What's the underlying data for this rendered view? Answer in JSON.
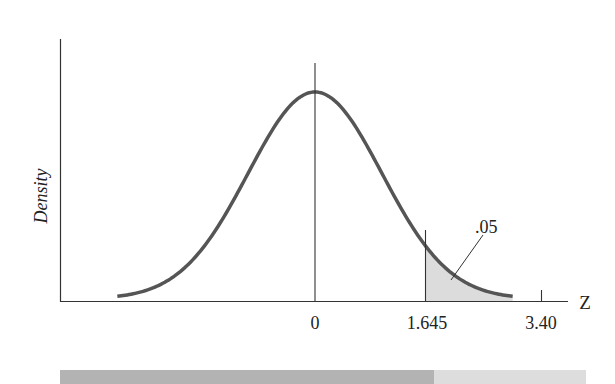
{
  "chart_data": {
    "type": "area",
    "title": "",
    "xlabel": "Z",
    "ylabel": "Density",
    "distribution": "standard normal",
    "x_ticks": [
      {
        "value": 0,
        "label": "0"
      },
      {
        "value": 1.645,
        "label": "1.645"
      },
      {
        "value": 3.4,
        "label": "3.40"
      }
    ],
    "shaded_region": {
      "from": 1.645,
      "to": "upper tail",
      "area": 0.05,
      "label": ".05"
    },
    "critical_value": 1.645,
    "test_statistic": 3.4,
    "xlim": [
      -3.5,
      3.9
    ],
    "grid": false,
    "legend": null,
    "bottom_bar": {
      "left_region": {
        "from": "-inf",
        "to": 1.645,
        "color": "#b3b3b3"
      },
      "right_region": {
        "from": 1.645,
        "to": "+inf",
        "color": "#dddddd"
      }
    }
  },
  "labels": {
    "ylabel": "Density",
    "xlabel": "Z",
    "tick_0": "0",
    "tick_crit": "1.645",
    "tick_stat": "3.40",
    "area_annotation": ".05"
  },
  "colors": {
    "curve": "#555555",
    "axis": "#333333",
    "shade": "#dcdcdc"
  }
}
